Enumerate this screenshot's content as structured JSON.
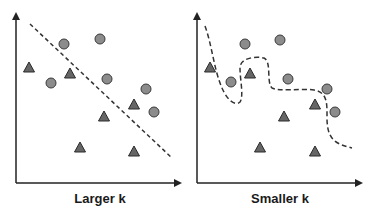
{
  "colors": {
    "axis": "#222222",
    "circle_fill": "#8c8c8c",
    "circle_stroke": "#3a3a3a",
    "triangle_fill": "#666666",
    "triangle_stroke": "#2a2a2a",
    "boundary": "#333333",
    "label": "#1a1a1a"
  },
  "panels": [
    {
      "id": "larger-k",
      "caption": "Larger k",
      "boundary_type": "linear",
      "circles": [
        [
          64,
          44
        ],
        [
          100,
          39
        ],
        [
          51,
          83
        ],
        [
          107,
          79
        ],
        [
          146,
          89
        ],
        [
          154,
          112
        ]
      ],
      "triangles": [
        [
          29,
          68
        ],
        [
          70,
          74
        ],
        [
          104,
          117
        ],
        [
          134,
          105
        ],
        [
          80,
          148
        ],
        [
          134,
          152
        ]
      ]
    },
    {
      "id": "smaller-k",
      "caption": "Smaller k",
      "boundary_type": "wiggly",
      "circles": [
        [
          245,
          44
        ],
        [
          280,
          40
        ],
        [
          231,
          82
        ],
        [
          288,
          79
        ],
        [
          327,
          89
        ],
        [
          335,
          112
        ]
      ],
      "triangles": [
        [
          210,
          68
        ],
        [
          250,
          74
        ],
        [
          284,
          117
        ],
        [
          315,
          105
        ],
        [
          260,
          148
        ],
        [
          315,
          152
        ]
      ]
    }
  ]
}
